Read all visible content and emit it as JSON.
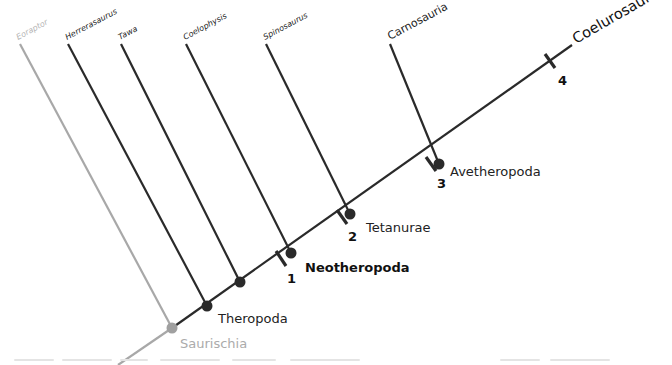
{
  "diagram": {
    "type": "cladogram",
    "colors": {
      "main_line": "#2a2a2a",
      "basal_line": "#a8a8a8",
      "node_fill": "#2a2a2a",
      "basal_node_fill": "#a0a0a0"
    },
    "terminal_taxa": [
      {
        "id": "eoraptor",
        "label": "Eoraptor",
        "basal": true
      },
      {
        "id": "herrerasaurus",
        "label": "Herrerasaurus",
        "basal": false
      },
      {
        "id": "tawa",
        "label": "Tawa",
        "basal": false
      },
      {
        "id": "coelophysis",
        "label": "Coelophysis",
        "basal": false
      },
      {
        "id": "spinosaurus",
        "label": "Spinosaurus",
        "basal": false
      },
      {
        "id": "carnosauria",
        "label": "Carnosauria",
        "basal": false
      },
      {
        "id": "coelurosauria",
        "label": "Coelurosauria",
        "basal": false
      }
    ],
    "clade_labels": {
      "saurischia": "Saurischia",
      "theropoda": "Theropoda",
      "neotheropoda": "Neotheropoda",
      "tetanurae": "Tetanurae",
      "avetheropoda": "Avetheropoda"
    },
    "character_ticks": [
      "1",
      "2",
      "3",
      "4"
    ]
  }
}
